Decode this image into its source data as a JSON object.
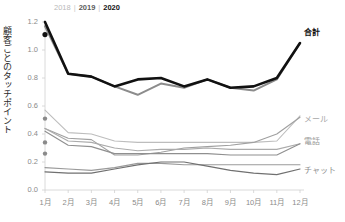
{
  "axis": {
    "ylabel": "顧客ごとのタッチポイント",
    "yticks": [
      "1.2",
      "1.0",
      "0.8",
      "0.6",
      "0.4",
      "0.2",
      "0.0"
    ],
    "xticks": [
      "1月",
      "2月",
      "3月",
      "4月",
      "5月",
      "6月",
      "7月",
      "8月",
      "9月",
      "10月",
      "11月",
      "12月"
    ]
  },
  "legend": {
    "y2018": "2018",
    "y2019": "2019",
    "y2020": "2020",
    "sep1": "|",
    "sep2": "|"
  },
  "series_labels": {
    "total": "合計",
    "mail": "メール",
    "phone": "電話",
    "chat": "チャット"
  },
  "colors": {
    "y2018": "#c4c4c4",
    "y2019": "#8c8c8c",
    "y2020": "#111111",
    "mail_2018": "#d8d8d8",
    "mail_2019": "#bdbdbd",
    "mail_2020": "#a0a0a0",
    "phone_2018": "#c9c9c9",
    "phone_2019": "#ababab",
    "phone_2020": "#8f8f8f",
    "chat_2018": "#bdbdbd",
    "chat_2019": "#9a9a9a",
    "chat_2020": "#707070",
    "axis": "#d0d0d0",
    "tick_text": "#8a8a8a"
  },
  "chart_data": {
    "type": "line",
    "title": "",
    "xlabel": "",
    "ylabel": "顧客ごとのタッチポイント",
    "ylim": [
      0.0,
      1.2
    ],
    "grid": false,
    "legend_position": "top-left",
    "categories": [
      "1月",
      "2月",
      "3月",
      "4月",
      "5月",
      "6月",
      "7月",
      "8月",
      "9月",
      "10月",
      "11月",
      "12月"
    ],
    "groups": [
      {
        "name": "合計",
        "series": [
          {
            "name": "2018",
            "values": [
              1.11,
              null,
              null,
              null,
              null,
              null,
              null,
              null,
              null,
              null,
              null,
              null
            ]
          },
          {
            "name": "2019",
            "values": [
              1.17,
              0.83,
              0.81,
              0.74,
              0.68,
              0.76,
              0.73,
              0.79,
              0.73,
              0.71,
              0.79,
              1.05
            ]
          },
          {
            "name": "2020",
            "values": [
              1.2,
              0.83,
              0.81,
              0.74,
              0.79,
              0.8,
              0.74,
              0.79,
              0.73,
              0.74,
              0.8,
              1.05
            ]
          }
        ]
      },
      {
        "name": "メール",
        "series": [
          {
            "name": "2018",
            "values": [
              0.51,
              null,
              null,
              null,
              null,
              null,
              null,
              null,
              null,
              null,
              null,
              null
            ]
          },
          {
            "name": "2019",
            "values": [
              0.57,
              0.41,
              0.4,
              0.35,
              0.34,
              0.34,
              0.34,
              0.34,
              0.34,
              0.34,
              0.35,
              0.53
            ]
          },
          {
            "name": "2020",
            "values": [
              0.44,
              0.37,
              0.36,
              0.25,
              0.25,
              0.27,
              0.3,
              0.31,
              0.32,
              0.34,
              0.4,
              0.52
            ]
          }
        ]
      },
      {
        "name": "電話",
        "series": [
          {
            "name": "2018",
            "values": [
              0.34,
              null,
              null,
              null,
              null,
              null,
              null,
              null,
              null,
              null,
              null,
              null
            ]
          },
          {
            "name": "2019",
            "values": [
              0.44,
              0.35,
              0.34,
              0.3,
              0.28,
              0.29,
              0.29,
              0.3,
              0.29,
              0.29,
              0.29,
              0.33
            ]
          },
          {
            "name": "2020",
            "values": [
              0.42,
              0.32,
              0.31,
              0.26,
              0.26,
              0.26,
              0.26,
              0.26,
              0.25,
              0.25,
              0.25,
              0.33
            ]
          }
        ]
      },
      {
        "name": "チャット",
        "series": [
          {
            "name": "2018",
            "values": [
              0.26,
              null,
              null,
              null,
              null,
              null,
              null,
              null,
              null,
              null,
              null,
              null
            ]
          },
          {
            "name": "2019",
            "values": [
              0.16,
              0.15,
              0.14,
              0.16,
              0.19,
              0.19,
              0.18,
              0.18,
              0.18,
              0.18,
              0.18,
              0.18
            ]
          },
          {
            "name": "2020",
            "values": [
              0.13,
              0.12,
              0.12,
              0.15,
              0.18,
              0.2,
              0.2,
              0.17,
              0.14,
              0.12,
              0.11,
              0.15
            ]
          }
        ]
      }
    ],
    "markers": [
      {
        "x": "1月",
        "y": 1.11,
        "series": "合計 2018"
      },
      {
        "x": "1月",
        "y": 0.51,
        "series": "メール 2018"
      },
      {
        "x": "1月",
        "y": 0.34,
        "series": "電話 2018"
      },
      {
        "x": "1月",
        "y": 0.26,
        "series": "チャット 2018"
      }
    ]
  }
}
